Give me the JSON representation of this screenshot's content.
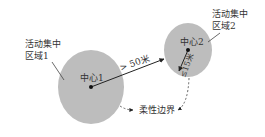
{
  "diagram": {
    "zone1": {
      "label_line1": "活动集中",
      "label_line2": "区域1",
      "center_label": "中心1"
    },
    "zone2": {
      "label_line1": "活动集中",
      "label_line2": "区域2",
      "center_label": "中心2"
    },
    "distance_label": "> 50米",
    "radius_label": "≤15米",
    "boundary_label": "柔性边界",
    "colors": {
      "zone_fill": "#bdbdbd",
      "line": "#222222",
      "text": "#333333"
    }
  }
}
